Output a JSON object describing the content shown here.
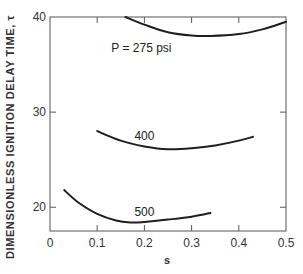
{
  "chart_data": {
    "type": "line",
    "title": "",
    "xlabel": "s",
    "ylabel": "DIMENSIONLESS IGNITION DELAY TIME, τ",
    "xlim": [
      0,
      0.5
    ],
    "ylim": [
      17.5,
      40
    ],
    "x_ticks": [
      "0",
      "0.1",
      "0.2",
      "0.3",
      "0.4",
      "0.5"
    ],
    "y_ticks": [
      "20",
      "30",
      "40"
    ],
    "grid": false,
    "legend": "inline curve labels",
    "series": [
      {
        "name": "P = 275 psi",
        "label": "P = 275 psi",
        "x": [
          0.16,
          0.2,
          0.25,
          0.3,
          0.34,
          0.4,
          0.45,
          0.5
        ],
        "y": [
          40.0,
          39.2,
          38.4,
          38.05,
          38.0,
          38.2,
          38.7,
          39.5
        ]
      },
      {
        "name": "400 psi",
        "label": "400",
        "x": [
          0.1,
          0.15,
          0.2,
          0.25,
          0.3,
          0.35,
          0.4,
          0.43
        ],
        "y": [
          28.0,
          27.0,
          26.4,
          26.1,
          26.2,
          26.5,
          27.0,
          27.4
        ]
      },
      {
        "name": "500 psi",
        "label": "500",
        "x": [
          0.03,
          0.06,
          0.1,
          0.14,
          0.17,
          0.2,
          0.25,
          0.3,
          0.34
        ],
        "y": [
          21.8,
          20.5,
          19.3,
          18.6,
          18.4,
          18.45,
          18.7,
          19.0,
          19.4
        ]
      }
    ]
  }
}
